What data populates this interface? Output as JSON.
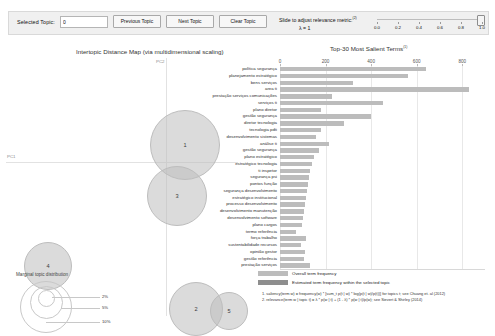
{
  "toolbar": {
    "selected_topic_label": "Selected Topic:",
    "selected_topic_value": "0",
    "previous_topic_label": "Previous Topic",
    "next_topic_label": "Next Topic",
    "clear_topic_label": "Clear Topic",
    "slider_caption": "Slide to adjust relevance metric:",
    "slider_caption_sup": "(2)",
    "lambda_label": "λ = 1",
    "slider_value": 1.0,
    "slider_ticks": [
      "0.0",
      "0.2",
      "0.4",
      "0.6",
      "0.8",
      "1.0"
    ]
  },
  "mds": {
    "title": "Intertopic Distance Map (via multidimensional scaling)",
    "axis_x_label": "PC1",
    "axis_y_label": "PC2",
    "legend_title": "Marginal topic distribution",
    "legend_rings": [
      "2%",
      "5%",
      "10%"
    ],
    "topics": [
      {
        "id": "1",
        "cx": 178,
        "cy": 86,
        "r": 34
      },
      {
        "id": "3",
        "cx": 170,
        "cy": 137,
        "r": 29
      },
      {
        "id": "2",
        "cx": 189,
        "cy": 250,
        "r": 26
      },
      {
        "id": "5",
        "cx": 222,
        "cy": 252,
        "r": 18
      },
      {
        "id": "4",
        "cx": 41,
        "cy": 207,
        "r": 23
      }
    ]
  },
  "chart_data": {
    "type": "bar",
    "title": "Top-30 Most Salient Terms",
    "title_sup": "(1)",
    "xlabel": "",
    "ylabel": "",
    "xlim": [
      0,
      900
    ],
    "xticks": [
      0,
      200,
      400,
      600,
      800
    ],
    "grid": true,
    "orientation": "horizontal",
    "legend_position": "bottom",
    "series": [
      {
        "name": "Overall term frequency",
        "color": "#bcbcbc"
      },
      {
        "name": "Estimated term frequency within the selected topic",
        "color": "#8e8e8e"
      }
    ],
    "categories": [
      "política segurança",
      "planejamento estratégico",
      "bens serviços",
      "area ti",
      "prestação serviços comunicações",
      "serviços ti",
      "plano diretor",
      "gestão segurança",
      "diretor tecnologia",
      "tecnologia pdti",
      "desenvolvimento sistemas",
      "análise ti",
      "gestão segurança",
      "plano estratégico",
      "estratégico tecnologia",
      "ti inspetor",
      "segurança psi",
      "pontos função",
      "segurança desenvolvimento",
      "estratégico institucional",
      "processo desenvolvimento",
      "desenvolvimento manutenção",
      "desenvolvimento software",
      "plano cargos",
      "termo referência",
      "força trabalho",
      "sustentabilidade recursos",
      "opinião gestor",
      "gestão referência",
      "prestação serviços"
    ],
    "values": [
      640,
      560,
      320,
      830,
      230,
      450,
      180,
      400,
      280,
      180,
      160,
      215,
      170,
      150,
      140,
      130,
      128,
      122,
      118,
      112,
      108,
      104,
      100,
      96,
      72,
      112,
      92,
      110,
      106,
      132
    ]
  },
  "footnotes": {
    "note1": "1. saliency(term w) = frequency(w) * [sum_t p(t | w) * log(p(t | w)/p(t))] for topics t; see Chuang et. al (2012)",
    "note2": "2. relevance(term w | topic t) = λ * p(w | t) + (1 - λ) * p(w | t)/p(w); see Sievert & Shirley (2014)"
  }
}
